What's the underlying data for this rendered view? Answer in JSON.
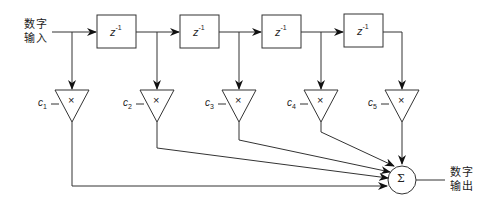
{
  "diagram": {
    "type": "FIR filter (tapped delay line) block diagram",
    "input_label": {
      "line1": "数字",
      "line2": "输入"
    },
    "output_label": {
      "line1": "数字",
      "line2": "输出"
    },
    "delay_blocks": [
      {
        "label": "z",
        "exp": "-1"
      },
      {
        "label": "z",
        "exp": "-1"
      },
      {
        "label": "z",
        "exp": "-1"
      },
      {
        "label": "z",
        "exp": "-1"
      }
    ],
    "multipliers": [
      {
        "coef": "c",
        "index": "1",
        "symbol": "×"
      },
      {
        "coef": "c",
        "index": "2",
        "symbol": "×"
      },
      {
        "coef": "c",
        "index": "3",
        "symbol": "×"
      },
      {
        "coef": "c",
        "index": "4",
        "symbol": "×"
      },
      {
        "coef": "c",
        "index": "5",
        "symbol": "×"
      }
    ],
    "summer": {
      "symbol": "Σ"
    },
    "colors": {
      "line": "#333333",
      "background": "#ffffff"
    }
  }
}
